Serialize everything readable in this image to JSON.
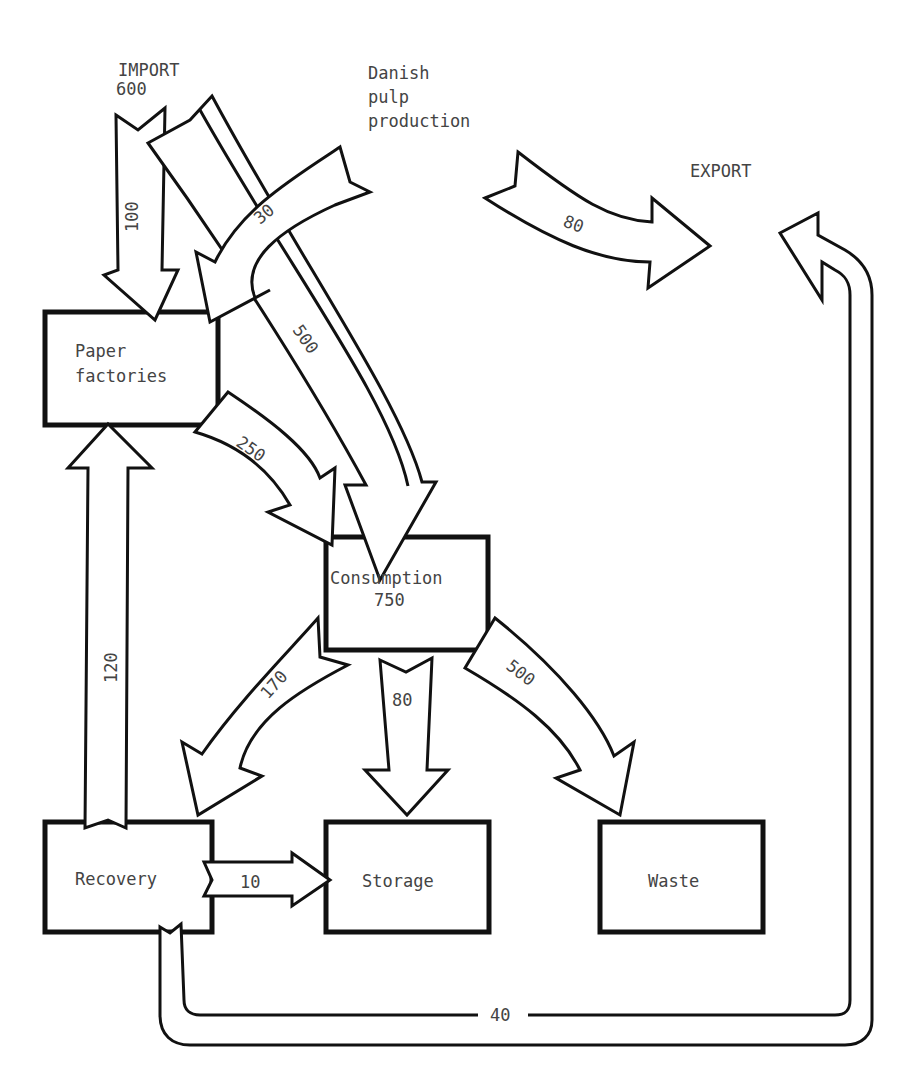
{
  "diagram": {
    "sources": {
      "import": {
        "label": "IMPORT",
        "value": "600"
      },
      "danish_pulp": {
        "line1": "Danish",
        "line2": "pulp",
        "line3": "production"
      },
      "export": {
        "label": "EXPORT"
      }
    },
    "nodes": {
      "paper_factories": {
        "line1": "Paper",
        "line2": "factories"
      },
      "consumption": {
        "line1": "Consumption",
        "line2": "750"
      },
      "recovery": {
        "label": "Recovery"
      },
      "storage": {
        "label": "Storage"
      },
      "waste": {
        "label": "Waste"
      }
    },
    "flows": {
      "import_to_factories": "100",
      "pulp_to_factories": "30",
      "import_to_consumption": "500",
      "pulp_to_export": "80",
      "factories_to_consumption": "250",
      "recovery_to_factories": "120",
      "consumption_to_recovery": "170",
      "consumption_to_storage": "80",
      "consumption_to_waste": "500",
      "recovery_to_storage": "10",
      "recovery_to_export": "40"
    }
  }
}
